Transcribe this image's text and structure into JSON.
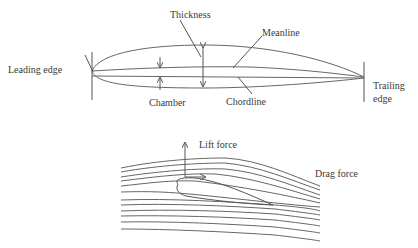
{
  "airfoil_diagram": {
    "labels": {
      "leading_edge": "Leading edge",
      "thickness": "Thickness",
      "meanline": "Meanline",
      "trailing_edge_line1": "Trailing",
      "trailing_edge_line2": "edge",
      "chamber": "Chamber",
      "chordline": "Chordline"
    }
  },
  "flow_diagram": {
    "labels": {
      "lift_force": "Lift force",
      "drag_force": "Drag force"
    }
  },
  "colors": {
    "line": "#555555",
    "text": "#3a3a3a",
    "background": "#ffffff"
  }
}
